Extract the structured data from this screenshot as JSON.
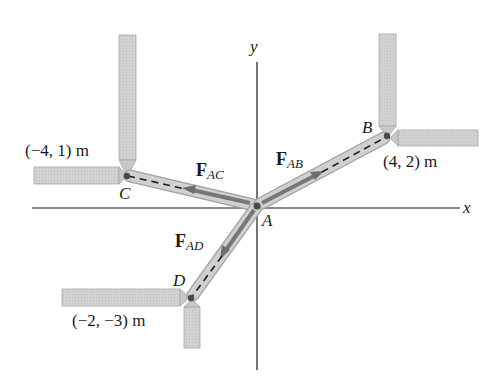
{
  "diagram": {
    "type": "statics-force-system",
    "axes": {
      "x_label": "x",
      "y_label": "y"
    },
    "points": {
      "A": {
        "label": "A",
        "coords_text": ""
      },
      "B": {
        "label": "B",
        "coords_text": "(4, 2) m"
      },
      "C": {
        "label": "C",
        "coords_text": "(−4, 1) m"
      },
      "D": {
        "label": "D",
        "coords_text": "(−2, −3) m"
      }
    },
    "forces": {
      "AB": {
        "symbol": "F",
        "subscript": "AB"
      },
      "AC": {
        "symbol": "F",
        "subscript": "AC"
      },
      "AD": {
        "symbol": "F",
        "subscript": "AD"
      }
    },
    "colors": {
      "rod_fill": "#cfcfcf",
      "rod_stroke": "#9a9a9a",
      "force_arrow": "#6e6e6e",
      "axis": "#1a1a1a",
      "joint": "#4a4a4a"
    }
  }
}
